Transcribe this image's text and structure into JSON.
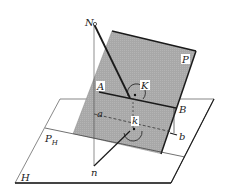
{
  "diagram": {
    "colors": {
      "plane_p_fill": "#a9a9a9",
      "plane_h_fill": "#ffffff",
      "line": "#1a1a1a",
      "thin_line": "#333333"
    },
    "labels": {
      "N": "N",
      "P": "P",
      "A": "A",
      "K": "K",
      "B": "B",
      "a": "a",
      "k": "k",
      "b": "b",
      "PH_main": "P",
      "PH_sub": "H",
      "H": "H",
      "n": "n"
    },
    "points": {
      "N": [
        94,
        24
      ],
      "K": [
        135,
        96
      ],
      "k": [
        134,
        129
      ],
      "n": [
        94,
        166
      ],
      "A": [
        99,
        92
      ],
      "B": [
        176,
        108
      ],
      "a": [
        94,
        114
      ],
      "b": [
        176,
        134
      ]
    },
    "planes": {
      "P": [
        [
          112,
          31
        ],
        [
          196,
          51
        ],
        [
          161,
          154
        ],
        [
          73,
          134
        ]
      ],
      "H": [
        [
          60,
          99
        ],
        [
          214,
          99
        ],
        [
          171,
          183
        ],
        [
          15,
          183
        ]
      ]
    }
  }
}
